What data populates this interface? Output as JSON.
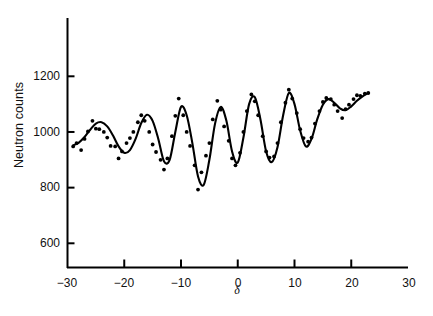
{
  "figure": {
    "background": "#ffffff",
    "ink_color": "#000000"
  },
  "axes": {
    "y_label": "Neutron counts",
    "x_label": "δ",
    "y_ticks": [
      600,
      800,
      1000,
      1200
    ],
    "y_tick_labels": [
      "600",
      "800",
      "1000",
      "1200"
    ],
    "x_ticks": [
      -30,
      -20,
      -10,
      0,
      10,
      20,
      30
    ],
    "x_tick_labels": [
      "−30",
      "−20",
      "−10",
      "0",
      "10",
      "20",
      "30"
    ]
  },
  "chart_data": {
    "type": "scatter",
    "title": "",
    "subtitle": "",
    "xlabel": "δ",
    "ylabel": "Neutron counts",
    "xlim": [
      -30,
      30
    ],
    "ylim": [
      520,
      1290
    ],
    "grid": false,
    "legend": null,
    "series": [
      {
        "name": "Measured neutron counts",
        "marker": "dot",
        "x": [
          -29.0,
          -28.4,
          -27.6,
          -27.0,
          -26.4,
          -25.6,
          -25.0,
          -24.4,
          -23.6,
          -23.0,
          -22.4,
          -21.6,
          -21.0,
          -20.4,
          -19.6,
          -19.0,
          -18.4,
          -17.6,
          -17.0,
          -16.4,
          -15.6,
          -15.0,
          -14.4,
          -13.6,
          -13.0,
          -12.4,
          -11.6,
          -11.0,
          -10.4,
          -9.6,
          -9.0,
          -8.4,
          -7.6,
          -7.0,
          -6.4,
          -5.6,
          -5.0,
          -4.4,
          -3.6,
          -3.0,
          -2.4,
          -1.6,
          -1.0,
          -0.4,
          0.4,
          1.0,
          1.6,
          2.4,
          3.0,
          3.6,
          4.4,
          5.0,
          5.6,
          6.4,
          7.0,
          7.6,
          8.4,
          9.0,
          9.6,
          10.4,
          11.0,
          11.6,
          12.4,
          13.0,
          13.6,
          14.4,
          15.0,
          15.6,
          16.4,
          17.0,
          17.6,
          18.4,
          19.0,
          19.6,
          20.4,
          21.0,
          21.6,
          22.4,
          23.0
        ],
        "y": [
          948,
          960,
          935,
          975,
          1002,
          1040,
          1012,
          1010,
          1000,
          980,
          950,
          948,
          905,
          930,
          960,
          978,
          1000,
          1035,
          1060,
          1040,
          1000,
          955,
          928,
          900,
          865,
          905,
          985,
          1058,
          1120,
          1060,
          1000,
          950,
          880,
          793,
          855,
          915,
          960,
          1045,
          1112,
          1080,
          1020,
          968,
          905,
          880,
          925,
          1000,
          1075,
          1135,
          1110,
          1060,
          985,
          930,
          908,
          912,
          960,
          1035,
          1105,
          1152,
          1120,
          1068,
          1010,
          978,
          965,
          980,
          1030,
          1075,
          1108,
          1122,
          1118,
          1098,
          1075,
          1050,
          1082,
          1098,
          1118,
          1132,
          1130,
          1138,
          1140
        ]
      },
      {
        "name": "Fitted curve",
        "marker": "line",
        "x": [
          -29.0,
          -28.0,
          -27.0,
          -26.0,
          -25.0,
          -24.0,
          -23.0,
          -22.0,
          -21.0,
          -20.0,
          -19.0,
          -18.0,
          -17.0,
          -16.0,
          -15.0,
          -14.0,
          -13.0,
          -12.0,
          -11.0,
          -10.0,
          -9.0,
          -8.0,
          -7.0,
          -6.0,
          -5.0,
          -4.0,
          -3.0,
          -2.0,
          -1.0,
          0.0,
          1.0,
          2.0,
          3.0,
          4.0,
          5.0,
          6.0,
          7.0,
          8.0,
          9.0,
          10.0,
          11.0,
          12.0,
          13.0,
          14.0,
          15.0,
          16.0,
          17.0,
          18.0,
          19.0,
          20.0,
          21.0,
          22.0,
          23.0
        ],
        "y": [
          952,
          962,
          982,
          1008,
          1030,
          1035,
          1020,
          988,
          948,
          925,
          935,
          975,
          1032,
          1062,
          1040,
          975,
          895,
          900,
          1000,
          1090,
          1060,
          960,
          840,
          810,
          900,
          1030,
          1090,
          1040,
          930,
          890,
          980,
          1100,
          1125,
          1045,
          930,
          892,
          945,
          1060,
          1140,
          1100,
          1005,
          948,
          975,
          1045,
          1098,
          1118,
          1105,
          1085,
          1078,
          1092,
          1112,
          1128,
          1140
        ]
      }
    ]
  }
}
